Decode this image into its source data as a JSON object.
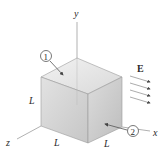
{
  "diagram": {
    "type": "cube-in-electric-field",
    "axes": {
      "x_label": "x",
      "y_label": "y",
      "z_label": "z"
    },
    "edge_label": "L",
    "field_label": "E",
    "field_arrow_count": 4,
    "face_markers": [
      {
        "id": "1",
        "label": "1",
        "face": "top"
      },
      {
        "id": "2",
        "label": "2",
        "face": "right"
      }
    ],
    "colors": {
      "axis": "#9a9a9a",
      "cube_top": "#e6e6e6",
      "cube_front": "#d2d2d2",
      "cube_right": "#c8c8c8",
      "edge": "#8f8f8f",
      "text": "#2a2a2a"
    }
  }
}
